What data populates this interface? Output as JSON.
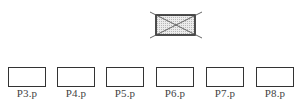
{
  "diagram": {
    "top_node": {
      "label": "",
      "icon": "crossed-out-box-icon",
      "fill": "#d9d9d9",
      "stroke": "#222222"
    },
    "nodes": [
      {
        "label": "P3.p",
        "x": 8
      },
      {
        "label": "P4.p",
        "x": 57
      },
      {
        "label": "P5.p",
        "x": 106
      },
      {
        "label": "P6.p",
        "x": 156
      },
      {
        "label": "P7.p",
        "x": 206
      },
      {
        "label": "P8.p",
        "x": 256
      }
    ]
  }
}
